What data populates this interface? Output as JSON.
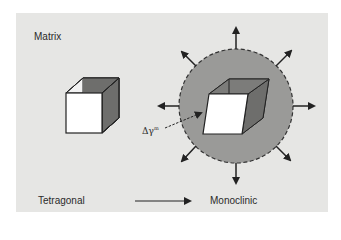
{
  "figure": {
    "labels": {
      "matrix": "Matrix",
      "start_phase": "Tetragonal",
      "end_phase": "Monoclinic",
      "strain": "Δγ",
      "strain_superscript": "m"
    },
    "colors": {
      "panel_bg": "#e6e6e4",
      "circle_fill": "#9a9a98",
      "cube_front": "#ffffff",
      "cube_side": "#6e6e6c",
      "outline": "#222222"
    },
    "elements": {
      "left_cube": "tetragonal-unit-cell",
      "right_cube": "monoclinic-unit-cell-sheared",
      "transformation_zone": "dashed-circle",
      "radial_arrows_count": 8
    }
  }
}
